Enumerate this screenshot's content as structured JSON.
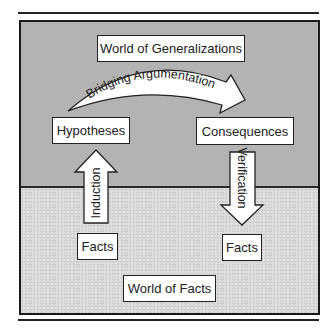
{
  "diagram": {
    "regions": {
      "top": {
        "label": "World of Generalizations",
        "color": "#b3b3b3"
      },
      "bottom": {
        "label": "World of Facts",
        "color": "#d8d8d8"
      }
    },
    "nodes": {
      "hypotheses": "Hypotheses",
      "consequences": "Consequences",
      "facts_left": "Facts",
      "facts_right": "Facts"
    },
    "arrows": {
      "bridging": "Bridging Argumentation",
      "induction": "Induction",
      "verification": "Verification"
    }
  }
}
